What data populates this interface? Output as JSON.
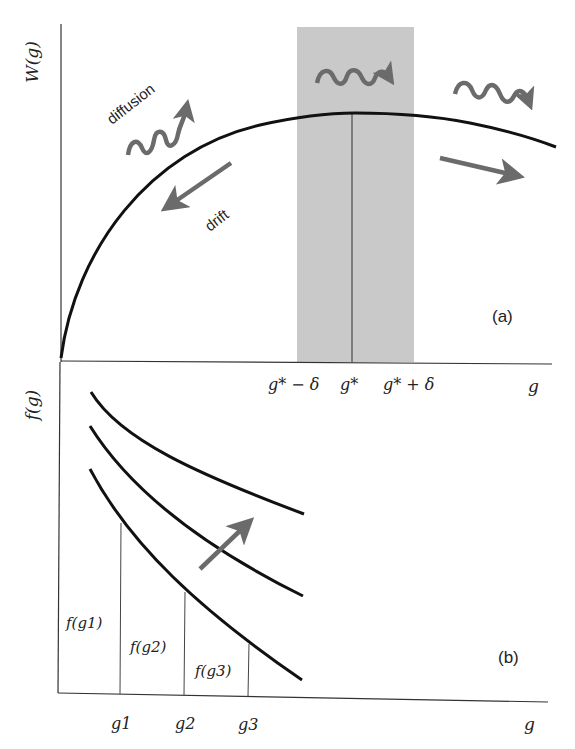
{
  "panel_a": {
    "label": "(a)",
    "y_axis_label": "W(g)",
    "x_axis_label": "g",
    "curve_name": "fitness landscape W(g)",
    "ticks": {
      "left": "g* − δ",
      "center": "g*",
      "right": "g* + δ"
    },
    "annotations": {
      "diffusion": "diffusion",
      "drift": "drift"
    },
    "shaded_band": "g* ± δ"
  },
  "panel_b": {
    "label": "(b)",
    "y_axis_label": "f(g)",
    "x_axis_label": "g",
    "curve_count": 3,
    "ticks": [
      "g1",
      "g2",
      "g3"
    ],
    "bar_labels": [
      "f(g1)",
      "f(g2)",
      "f(g3)"
    ]
  },
  "colors": {
    "curve": "#111111",
    "axis": "#333333",
    "arrow": "#6b6b6b",
    "band": "#c9c9c9",
    "text": "#222222"
  }
}
